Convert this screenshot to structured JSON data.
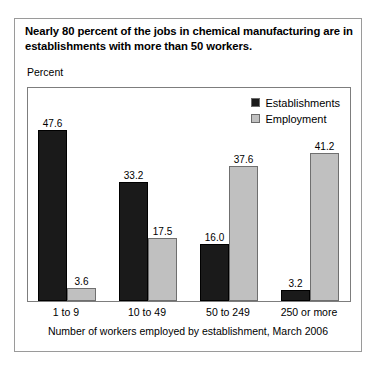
{
  "figure": {
    "title": "Nearly 80 percent of the jobs in chemical manufacturing are in establishments with more than 50 workers.",
    "y_axis_label": "Percent",
    "caption": "Number of workers employed by establishment, March 2006",
    "colors": {
      "establishments": "#1a1a1a",
      "employment": "#c0c0c0",
      "frame": "#7d7d7d",
      "outer_border": "#9a9a9a",
      "background": "#ffffff",
      "text": "#000000"
    }
  },
  "legend": {
    "items": [
      {
        "label": "Establishments",
        "color": "#1a1a1a",
        "swatch": "dark"
      },
      {
        "label": "Employment",
        "color": "#c0c0c0",
        "swatch": "light"
      }
    ]
  },
  "chart_data": {
    "type": "bar",
    "title": "Nearly 80 percent of the jobs in chemical manufacturing are in establishments with more than 50 workers.",
    "xlabel": "Number of workers employed by establishment, March 2006",
    "ylabel": "Percent",
    "categories": [
      "1 to 9",
      "10 to 49",
      "50 to 249",
      "250 or more"
    ],
    "series": [
      {
        "name": "Establishments",
        "color": "#1a1a1a",
        "values": [
          47.6,
          33.2,
          16.0,
          3.2
        ]
      },
      {
        "name": "Employment",
        "color": "#c0c0c0",
        "values": [
          3.6,
          17.5,
          37.6,
          41.2
        ]
      }
    ],
    "value_labels": [
      [
        "47.6",
        "3.6"
      ],
      [
        "33.2",
        "17.5"
      ],
      [
        "16.0",
        "37.6"
      ],
      [
        "3.2",
        "41.2"
      ]
    ],
    "ylim": [
      0,
      60
    ],
    "grid": false,
    "legend_position": "top-right",
    "axis_ticks_visible": false
  }
}
